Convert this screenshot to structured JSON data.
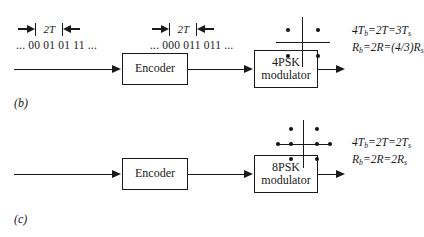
{
  "figure": {
    "panels": [
      {
        "id": "b",
        "caption": "(b)",
        "timing_left_label": "2T",
        "timing_right_label": "2T",
        "input_sequence": "... 00 01 01 11 ...",
        "encoded_sequence": "... 000 011 011 ...",
        "encoder_label": "Encoder",
        "modulator_label_line1": "4PSK",
        "modulator_label_line2": "modulator",
        "constellation": {
          "name": "4psk-constellation",
          "points": 4,
          "point_positions": [
            {
              "x": 26,
              "y": 29
            },
            {
              "x": 55,
              "y": 29
            },
            {
              "x": 26,
              "y": 56
            },
            {
              "x": 55,
              "y": 56
            }
          ]
        },
        "equations": [
          "4Tb=2T=3Ts",
          "Rb=2R=(4/3)Rs"
        ],
        "eq1": {
          "lhs": "4T",
          "lhs_sub": "b",
          "mid": "2T",
          "rhs": "3T",
          "rhs_sub": "s"
        },
        "eq2": {
          "lhs": "R",
          "lhs_sub": "b",
          "mid": "2R",
          "rhs": "(4/3)R",
          "rhs_sub": "s"
        }
      },
      {
        "id": "c",
        "caption": "(c)",
        "encoder_label": "Encoder",
        "modulator_label_line1": "8PSK",
        "modulator_label_line2": "modulator",
        "constellation": {
          "name": "8psk-constellation",
          "points": 8,
          "point_positions": [
            {
              "x": 27,
              "y": 5
            },
            {
              "x": 46,
              "y": 5
            },
            {
              "x": 8,
              "y": 22
            },
            {
              "x": 27,
              "y": 22
            },
            {
              "x": 46,
              "y": 22
            },
            {
              "x": 65,
              "y": 22
            },
            {
              "x": 27,
              "y": 39
            },
            {
              "x": 46,
              "y": 39
            }
          ]
        },
        "equations": [
          "4Tb=2T=2Ts",
          "Rb=2R=2Rs"
        ],
        "eq1": {
          "lhs": "4T",
          "lhs_sub": "b",
          "mid": "2T",
          "rhs": "2T",
          "rhs_sub": "s"
        },
        "eq2": {
          "lhs": "R",
          "lhs_sub": "b",
          "mid": "2R",
          "rhs": "2R",
          "rhs_sub": "s"
        }
      }
    ],
    "colors": {
      "ink": "#1a1a1a",
      "background": "#ffffff"
    }
  }
}
